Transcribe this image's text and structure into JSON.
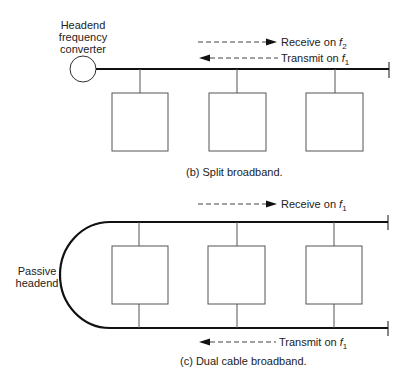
{
  "split": {
    "headend_label": [
      "Headend",
      "frequency",
      "converter"
    ],
    "receive_label": "Receive on ",
    "receive_freq": "f",
    "receive_sub": "2",
    "transmit_label": "Transmit on ",
    "transmit_freq": "f",
    "transmit_sub": "1",
    "caption": "(b)  Split broadband.",
    "station_count": 3
  },
  "dual": {
    "headend_label": [
      "Passive",
      "headend"
    ],
    "receive_label": "Receive on ",
    "receive_freq": "f",
    "receive_sub": "1",
    "transmit_label": "Transmit on ",
    "transmit_freq": "f",
    "transmit_sub": "1",
    "caption": "(c)  Dual cable broadband.",
    "station_count": 3
  }
}
